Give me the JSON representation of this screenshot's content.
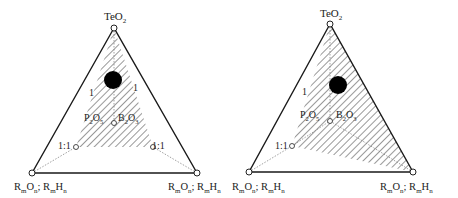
{
  "diagrams": [
    {
      "id": "left",
      "apex_label": "TeO",
      "apex_sub": "2",
      "bottom_left_label": {
        "a": "R",
        "a_sub": "m",
        "b": "O",
        "b_sub": "n",
        "sep": "; ",
        "c": "R",
        "c_sub": "m",
        "d": "H",
        "d_sub": "n"
      },
      "bottom_right_label": {
        "a": "R",
        "a_sub": "m",
        "b": "O",
        "b_sub": "n",
        "sep": "; ",
        "c": "R",
        "c_sub": "m",
        "d": "H",
        "d_sub": "n"
      },
      "inner_left_label": {
        "a": "P",
        "a_sub": "2",
        "b": "O",
        "b_sub": "5"
      },
      "inner_right_label": {
        "a": "B",
        "a_sub": "2",
        "b": "O",
        "b_sub": "3"
      },
      "ratio_left": "1:1",
      "ratio_right": "1:1",
      "edge_label_left": "1",
      "edge_label_right": "1"
    },
    {
      "id": "right",
      "apex_label": "TeO",
      "apex_sub": "2",
      "bottom_left_label": {
        "a": "R",
        "a_sub": "m",
        "b": "O",
        "b_sub": "n",
        "sep": "; ",
        "c": "R",
        "c_sub": "m",
        "d": "H",
        "d_sub": "n"
      },
      "bottom_right_label": {
        "a": "R",
        "a_sub": "m",
        "b": "O",
        "b_sub": "n",
        "sep": "; ",
        "c": "R",
        "c_sub": "m",
        "d": "H",
        "d_sub": "n"
      },
      "inner_left_label": {
        "a": "P",
        "a_sub": "2",
        "b": "O",
        "b_sub": "5"
      },
      "inner_right_label": {
        "a": "B",
        "a_sub": "2",
        "b": "O",
        "b_sub": "3"
      },
      "ratio_left": "1:1",
      "edge_label_left": "1"
    }
  ],
  "colors": {
    "outline": "#1a1a1a",
    "hatch": "#333333",
    "dotted": "#888888",
    "dot": "#000000"
  }
}
